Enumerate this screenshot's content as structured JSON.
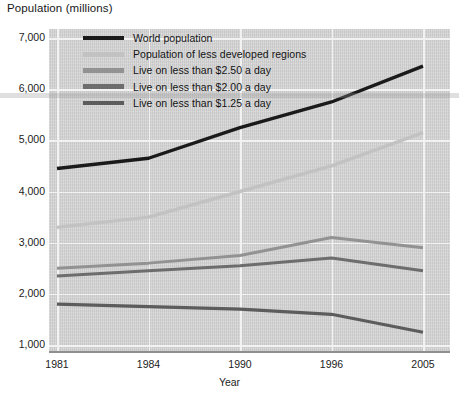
{
  "chart_data": {
    "type": "line",
    "title": "",
    "ylabel": "Population (millions)",
    "xlabel": "Year",
    "categories": [
      "1981",
      "1984",
      "1990",
      "1996",
      "2005"
    ],
    "ylim": [
      1000,
      7000
    ],
    "yticks": [
      "7,000",
      "6,000",
      "5,000",
      "4,000",
      "3,000",
      "2,000",
      "1,000"
    ],
    "ytick_values": [
      7000,
      6000,
      5000,
      4000,
      3000,
      2000,
      1000
    ],
    "grid": true,
    "legend_position": "top-left-inside",
    "series": [
      {
        "name": "World population",
        "color": "#1a1a1a",
        "width": 3.4,
        "values": [
          4450,
          4650,
          5250,
          5750,
          6450
        ]
      },
      {
        "name": "Population of less developed regions",
        "color": "#c2c2c2",
        "width": 3.4,
        "values": [
          3300,
          3500,
          4000,
          4500,
          5150
        ]
      },
      {
        "name": "Live on less than $2.50 a day",
        "color": "#929292",
        "width": 3.0,
        "values": [
          2500,
          2600,
          2750,
          3100,
          2900
        ]
      },
      {
        "name": "Live on less than $2.00 a day",
        "color": "#6d6d6d",
        "width": 3.0,
        "values": [
          2350,
          2450,
          2550,
          2700,
          2450
        ]
      },
      {
        "name": "Live on less than $1.25 a day",
        "color": "#5c5c5c",
        "width": 3.2,
        "values": [
          1800,
          1750,
          1700,
          1600,
          1250
        ]
      }
    ]
  },
  "colors": {
    "plot_background": "#d4d4d4",
    "gridline": "#f2f2f2",
    "axis": "#8f8f8f",
    "text": "#1c1c1c"
  }
}
